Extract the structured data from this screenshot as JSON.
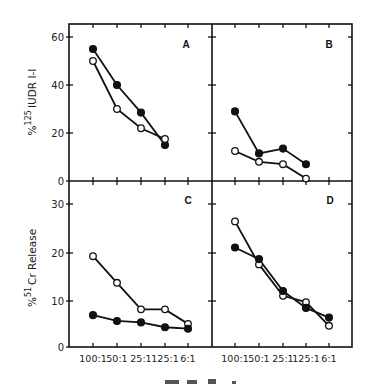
{
  "chart_data": [
    {
      "panel": "A",
      "type": "line",
      "categories": [
        "100:1",
        "50:1",
        "25:1",
        "125:1",
        "6:1"
      ],
      "series": [
        {
          "name": "filled",
          "marker": "filled-circle",
          "values": [
            55,
            40,
            28.5,
            15,
            null
          ]
        },
        {
          "name": "open",
          "marker": "open-circle",
          "values": [
            50,
            30,
            22,
            17.5,
            null
          ]
        }
      ],
      "ylabel": "% 125IUDR I-I",
      "ylim": [
        0,
        60
      ],
      "yticks": [
        0,
        20,
        40,
        60
      ]
    },
    {
      "panel": "B",
      "type": "line",
      "categories": [
        "100:1",
        "50:1",
        "25:1",
        "125:1",
        "6:1"
      ],
      "series": [
        {
          "name": "filled",
          "marker": "filled-circle",
          "values": [
            29,
            11.5,
            13.5,
            7,
            null
          ]
        },
        {
          "name": "open",
          "marker": "open-circle",
          "values": [
            12.5,
            8,
            7,
            1,
            null
          ]
        }
      ],
      "ylim": [
        0,
        60
      ],
      "yticks": [
        0,
        20,
        40,
        60
      ]
    },
    {
      "panel": "C",
      "type": "line",
      "categories": [
        "100:1",
        "50:1",
        "25:1",
        "125:1",
        "6:1"
      ],
      "series": [
        {
          "name": "open",
          "marker": "open-circle",
          "values": [
            19.2,
            13.7,
            8.2,
            8.2,
            5.2
          ]
        },
        {
          "name": "filled",
          "marker": "filled-circle",
          "values": [
            7,
            5.8,
            5.5,
            4.5,
            4.2
          ]
        }
      ],
      "ylabel": "% 51Cr Release",
      "ylim": [
        0,
        33
      ],
      "yticks": [
        0,
        10,
        20,
        30
      ]
    },
    {
      "panel": "D",
      "type": "line",
      "categories": [
        "100:1",
        "50:1",
        "25:1",
        "125:1",
        "6:1"
      ],
      "series": [
        {
          "name": "open",
          "marker": "open-circle",
          "values": [
            26.4,
            17.5,
            11,
            9.7,
            4.8
          ]
        },
        {
          "name": "filled",
          "marker": "filled-circle",
          "values": [
            21,
            18.6,
            12,
            8.5,
            6.5
          ]
        }
      ],
      "ylim": [
        0,
        33
      ],
      "yticks": [
        0,
        10,
        20,
        30
      ]
    }
  ],
  "labels": {
    "top_ylabel_prefix": "%",
    "top_ylabel_sup": "125",
    "top_ylabel_main": "IUDR I-I",
    "bottom_ylabel_prefix": "%",
    "bottom_ylabel_sup": "51",
    "bottom_ylabel_main": "Cr Release",
    "panel_A": "A",
    "panel_B": "B",
    "panel_C": "C",
    "panel_D": "D",
    "top_yticks": [
      "0",
      "20",
      "40",
      "60"
    ],
    "bottom_yticks": [
      "0",
      "10",
      "20",
      "30"
    ],
    "xticks": [
      "100:1",
      "50:1",
      "25:1",
      "125:1",
      "6:1"
    ]
  }
}
